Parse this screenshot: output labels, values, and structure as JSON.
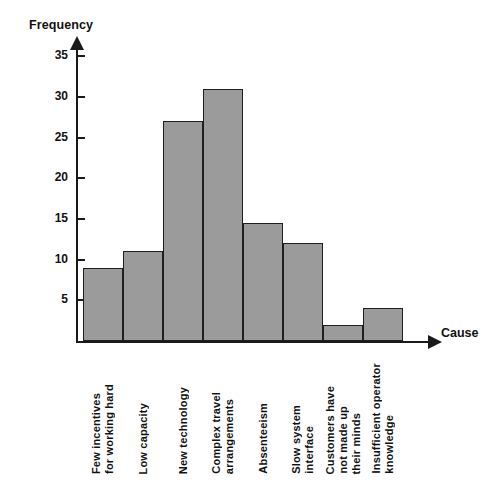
{
  "chart_data": {
    "type": "bar",
    "title": "",
    "xlabel": "Cause",
    "ylabel": "Frequency",
    "categories": [
      "Few incentives for working hard",
      "Low capacity",
      "New technology",
      "Complex travel arrangements",
      "Absenteeism",
      "Slow system interface",
      "Customers have not made up their minds",
      "Insufficient operator knowledge"
    ],
    "category_lines": [
      [
        "Few incentives",
        "for working hard"
      ],
      [
        "Low capacity"
      ],
      [
        "New technology"
      ],
      [
        "Complex travel",
        "arrangements"
      ],
      [
        "Absenteeism"
      ],
      [
        "Slow system",
        "interface"
      ],
      [
        "Customers have",
        "not made up",
        "their minds"
      ],
      [
        "Insufficient operator",
        "knowledge"
      ]
    ],
    "values": [
      9,
      11,
      27,
      31,
      14.5,
      12,
      2,
      4
    ],
    "ylim": [
      0,
      36
    ],
    "yticks": [
      5,
      10,
      15,
      20,
      25,
      30,
      35
    ],
    "ytick_labels": [
      "5",
      "10",
      "15",
      "20",
      "25",
      "30",
      "35"
    ],
    "grid": false,
    "legend": "none",
    "bar_fill_color": "#9b9b9b",
    "bar_border_color": "#1f1f1f",
    "axis_color": "#1a1a1a",
    "background_color": "#ffffff"
  },
  "axes": {
    "y_title": "Frequency",
    "x_title": "Cause"
  }
}
